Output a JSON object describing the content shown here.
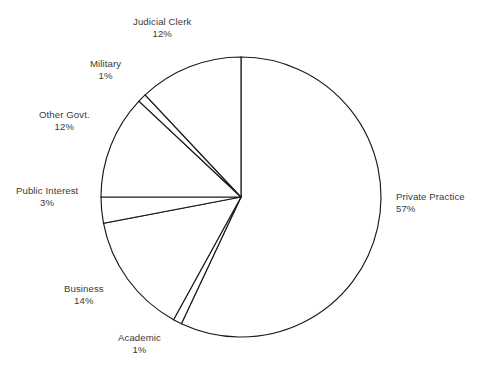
{
  "chart_data": {
    "type": "pie",
    "title": "",
    "subtitle": "",
    "xlabel": "",
    "ylabel": "",
    "grid": false,
    "legend_position": "outside-labels",
    "value_unit": "%",
    "start_angle_deg": 0,
    "direction": "clockwise",
    "center": {
      "x": 241,
      "y": 197
    },
    "radius": 140,
    "total": 100,
    "categories": [
      "Private Practice",
      "Academic",
      "Business",
      "Public Interest",
      "Other Govt.",
      "Military",
      "Judicial Clerk"
    ],
    "values": [
      57,
      1,
      14,
      3,
      12,
      1,
      12
    ],
    "slices": [
      {
        "label": "Private Practice",
        "value": 57,
        "value_text": "57%",
        "start_pct": 0,
        "end_pct": 57,
        "label_align": "left",
        "label_x": 396,
        "label_y": 191
      },
      {
        "label": "Academic",
        "value": 1,
        "value_text": "1%",
        "start_pct": 57,
        "end_pct": 58,
        "label_align": "center",
        "label_x": 118,
        "label_y": 332
      },
      {
        "label": "Business",
        "value": 14,
        "value_text": "14%",
        "start_pct": 58,
        "end_pct": 72,
        "label_align": "center",
        "label_x": 64,
        "label_y": 283
      },
      {
        "label": "Public Interest",
        "value": 3,
        "value_text": "3%",
        "start_pct": 72,
        "end_pct": 75,
        "label_align": "center",
        "label_x": 16,
        "label_y": 185
      },
      {
        "label": "Other Govt.",
        "value": 12,
        "value_text": "12%",
        "start_pct": 75,
        "end_pct": 87,
        "label_align": "center",
        "label_x": 39,
        "label_y": 109
      },
      {
        "label": "Military",
        "value": 1,
        "value_text": "1%",
        "start_pct": 87,
        "end_pct": 88,
        "label_align": "center",
        "label_x": 90,
        "label_y": 58
      },
      {
        "label": "Judicial Clerk",
        "value": 12,
        "value_text": "12%",
        "start_pct": 88,
        "end_pct": 100,
        "label_align": "center",
        "label_x": 133,
        "label_y": 16
      }
    ],
    "colors": {
      "slice_fill": "#ffffff",
      "slice_stroke": "#1a1a1a",
      "label_text": "#3a3a3a",
      "background": "#ffffff"
    }
  }
}
